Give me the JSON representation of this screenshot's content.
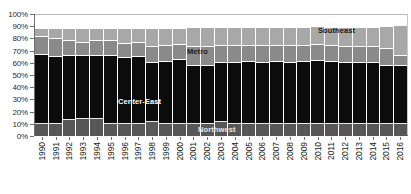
{
  "chart_data": {
    "type": "bar",
    "subtype": "stacked-bar",
    "title": "",
    "xlabel": "",
    "ylabel": "",
    "ylim": [
      0,
      100
    ],
    "ytick_labels": [
      "100%",
      "90%",
      "80%",
      "70%",
      "60%",
      "50%",
      "40%",
      "30%",
      "20%",
      "10%",
      "0%"
    ],
    "ytick_values": [
      100,
      90,
      80,
      70,
      60,
      50,
      40,
      30,
      20,
      10,
      0
    ],
    "grid": false,
    "legend": "inline-annotations",
    "categories": [
      "1990",
      "1991",
      "1992",
      "1993",
      "1994",
      "1995",
      "1996",
      "1997",
      "1998",
      "1999",
      "2000",
      "2001",
      "2002",
      "2003",
      "2004",
      "2005",
      "2006",
      "2007",
      "2008",
      "2009",
      "2010",
      "2011",
      "2012",
      "2013",
      "2014",
      "2015",
      "2016"
    ],
    "series": [
      {
        "name": "Northwest",
        "color": "#575757",
        "values": [
          11,
          11,
          14,
          15,
          15,
          11,
          11,
          11,
          12,
          11,
          11,
          11,
          11,
          12,
          11,
          11,
          11,
          11,
          11,
          11,
          11,
          11,
          11,
          11,
          11,
          11,
          11
        ]
      },
      {
        "name": "Center-East",
        "color": "#0c0c0c",
        "values": [
          57,
          55,
          53,
          52,
          52,
          56,
          54,
          55,
          49,
          51,
          53,
          48,
          48,
          49,
          50,
          51,
          50,
          51,
          50,
          51,
          52,
          51,
          50,
          50,
          50,
          48,
          48
        ]
      },
      {
        "name": "Metro",
        "color": "#8a8a8a",
        "values": [
          15,
          15,
          12,
          11,
          12,
          12,
          12,
          12,
          13,
          13,
          12,
          15,
          15,
          14,
          14,
          13,
          14,
          13,
          14,
          13,
          13,
          13,
          13,
          13,
          13,
          14,
          8
        ]
      },
      {
        "name": "Southeast",
        "color": "#a8a8a8",
        "values": [
          6,
          8,
          10,
          11,
          10,
          10,
          12,
          11,
          15,
          14,
          13,
          16,
          16,
          15,
          15,
          15,
          15,
          15,
          15,
          15,
          15,
          15,
          16,
          16,
          16,
          18,
          25
        ]
      }
    ],
    "annotations": [
      {
        "text": "Northwest",
        "series": "Northwest"
      },
      {
        "text": "Center-East",
        "series": "Center-East"
      },
      {
        "text": "Metro",
        "series": "Metro"
      },
      {
        "text": "Southeast",
        "series": "Southeast"
      }
    ]
  }
}
